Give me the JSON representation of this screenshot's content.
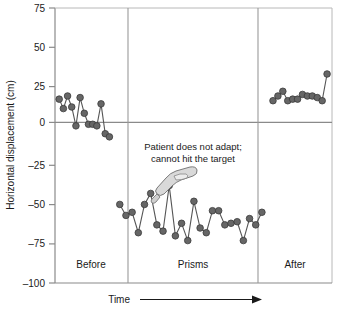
{
  "chart_data": {
    "type": "scatter",
    "title": "",
    "xlabel": "Time",
    "ylabel": "Horizontal displacement (cm)",
    "ylim": [
      -100,
      75
    ],
    "yticks": [
      75,
      50,
      25,
      0,
      -25,
      -50,
      -75,
      -100
    ],
    "ytick_labels": [
      "75",
      "50",
      "25",
      "0",
      "–25",
      "–50",
      "–75",
      "–100"
    ],
    "grid": false,
    "legend_position": "none",
    "zero_line": 0,
    "marker_color": "#666666",
    "marker_edge_color": "#3a3a3a",
    "line_color": "#555555",
    "axis_color": "#888888",
    "phases": [
      {
        "name": "Before",
        "label": "Before",
        "x_range": [
          0,
          11
        ],
        "values": [
          17,
          11,
          19,
          12,
          0,
          18,
          8,
          1,
          1,
          0,
          14,
          -5,
          -7
        ]
      },
      {
        "name": "Prisms",
        "label": "Prisms",
        "x_range": [
          11,
          40
        ],
        "values": [
          -50,
          -57,
          -55,
          -68,
          -50,
          -43,
          -63,
          -67,
          -38,
          -70,
          -62,
          -73,
          -48,
          -65,
          -68,
          -54,
          -54,
          -63,
          -62,
          -61,
          -73,
          -59,
          -63,
          -55
        ]
      },
      {
        "name": "After",
        "label": "After",
        "x_range": [
          40,
          52
        ],
        "values": [
          16,
          19,
          22,
          16,
          17,
          17,
          20,
          19,
          19,
          18,
          16,
          33
        ]
      }
    ],
    "annotations": [
      {
        "name": "no-adapt-note",
        "line1": "Patient does not adapt;",
        "line2": "cannot hit the target"
      }
    ],
    "time_arrow_label": "Time"
  }
}
